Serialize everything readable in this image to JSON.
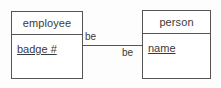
{
  "diagram": {
    "type": "entity-relationship",
    "canvas": {
      "width": 221,
      "height": 88,
      "background": "#fdfdfd"
    },
    "line_color": "#555555",
    "text_color": "#3a3a3a",
    "entities": [
      {
        "id": "employee",
        "name": "employee",
        "attributes": [
          {
            "label": "badge #",
            "is_key": true
          }
        ]
      },
      {
        "id": "person",
        "name": "person",
        "attributes": [
          {
            "label": "name",
            "is_key": true
          }
        ]
      }
    ],
    "relationship": {
      "label_left": "be",
      "label_right": "be",
      "from": "employee",
      "to": "person"
    }
  }
}
